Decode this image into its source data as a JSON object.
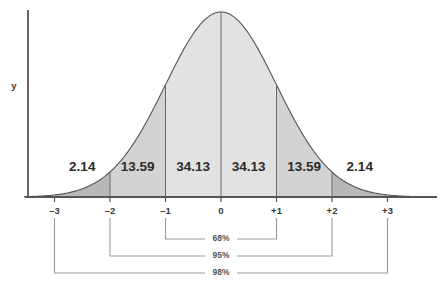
{
  "chart_data": {
    "type": "area",
    "title": "",
    "subtitle": "",
    "xlabel": "",
    "ylabel": "y",
    "grid": false,
    "legend": "none",
    "distribution": "standard normal",
    "xlim": [
      -3.6,
      3.6
    ],
    "ylim": [
      0,
      1.05
    ],
    "x_tick_labels": [
      "–3",
      "–2",
      "–1",
      "0",
      "+1",
      "+2",
      "+3"
    ],
    "x_tick_values": [
      -3,
      -2,
      -1,
      0,
      1,
      2,
      3
    ],
    "categories": [
      "–3 to –2",
      "–2 to –1",
      "–1 to 0",
      "0 to +1",
      "+1 to +2",
      "+2 to +3"
    ],
    "values": [
      2.14,
      13.59,
      34.13,
      34.13,
      13.59,
      2.14
    ],
    "value_unit": "percent",
    "bands": [
      {
        "label": "2.14",
        "from": -3,
        "to": -2,
        "shade": "dark"
      },
      {
        "label": "13.59",
        "from": -2,
        "to": -1,
        "shade": "mid"
      },
      {
        "label": "34.13",
        "from": -1,
        "to": 0,
        "shade": "light"
      },
      {
        "label": "34.13",
        "from": 0,
        "to": 1,
        "shade": "light"
      },
      {
        "label": "13.59",
        "from": 1,
        "to": 2,
        "shade": "mid"
      },
      {
        "label": "2.14",
        "from": 2,
        "to": 3,
        "shade": "dark"
      }
    ],
    "brackets": [
      {
        "label": "68%",
        "from": -1,
        "to": 1
      },
      {
        "label": "95%",
        "from": -2,
        "to": 2
      },
      {
        "label": "98%",
        "from": -3,
        "to": 3
      }
    ],
    "annotations": [
      "68%",
      "95%",
      "98%"
    ]
  },
  "colors": {
    "curve_stroke": "#555555",
    "axis": "#555555",
    "band_light": "#e2e2e2",
    "band_mid": "#d3d3d3",
    "band_dark": "#b8b8b8",
    "divider": "#6b6b6b",
    "bracket": "#9a9a9a",
    "text": "#2b2b2b",
    "background": "#ffffff"
  }
}
